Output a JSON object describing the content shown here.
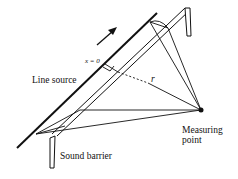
{
  "diagram": {
    "labels": {
      "line_source": "Line source",
      "x_zero": "x = 0",
      "r": "r",
      "measuring_point_line1": "Measuring",
      "measuring_point_line2": "point",
      "sound_barrier": "Sound barrier"
    },
    "colors": {
      "stroke": "#111111",
      "background": "#ffffff"
    }
  }
}
